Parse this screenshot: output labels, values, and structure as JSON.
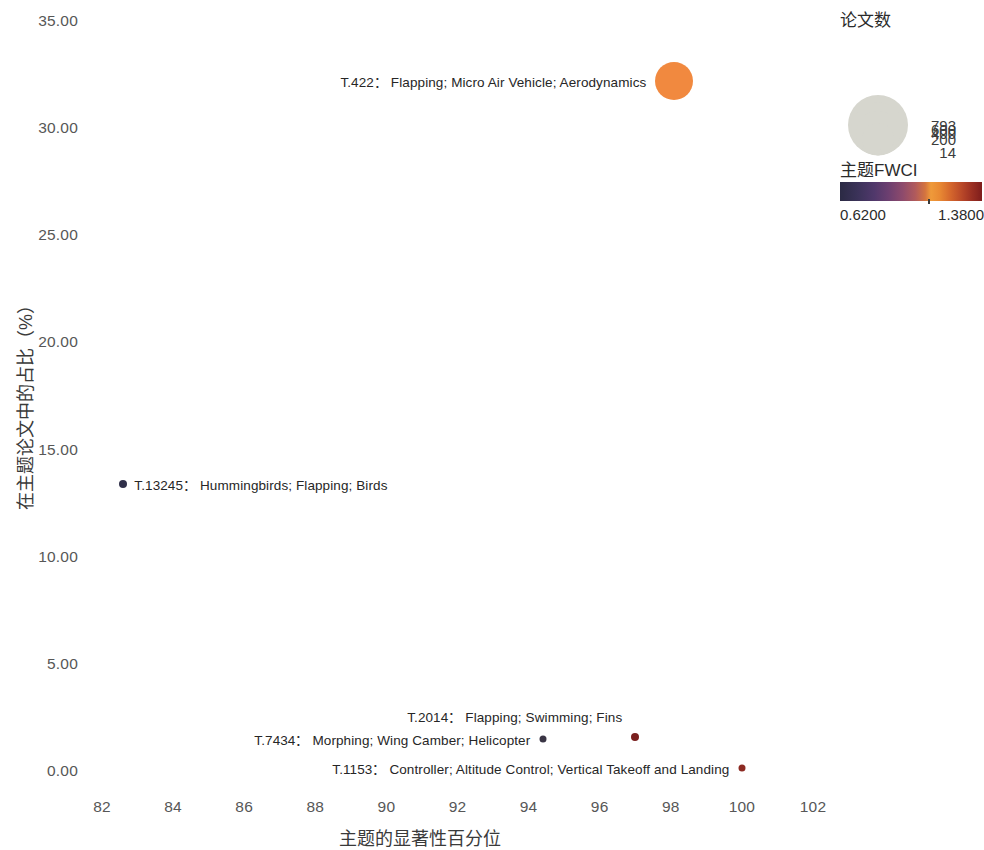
{
  "chart_data": {
    "type": "scatter",
    "title": "",
    "xlabel": "主题的显著性百分位",
    "ylabel": "在主题论文中的占比（%）",
    "xlim": [
      81.0,
      103.0
    ],
    "ylim": [
      -1.2,
      35.8
    ],
    "x_ticks": [
      82,
      84,
      86,
      88,
      90,
      92,
      94,
      96,
      98,
      100,
      102
    ],
    "x_tick_labels": [
      "82",
      "84",
      "86",
      "88",
      "90",
      "92",
      "94",
      "96",
      "98",
      "100",
      "102"
    ],
    "y_ticks": [
      0,
      5,
      10,
      15,
      20,
      25,
      30,
      35
    ],
    "y_tick_labels": [
      "0.00",
      "5.00",
      "10.00",
      "15.00",
      "20.00",
      "25.00",
      "30.00",
      "35.00"
    ],
    "grid": false,
    "legend_position": "right",
    "size_field": "论文数",
    "color_field": "主题FWCI",
    "points": [
      {
        "id": "T.422",
        "keywords": "Flapping; Micro Air Vehicle; Aerodynamics",
        "label": "T.422：  Flapping; Micro Air Vehicle; Aerodynamics",
        "x": 98.1,
        "y": 32.2,
        "papers": 793,
        "fwci": 1.11,
        "color": "#f1893f",
        "radius_px": 19,
        "label_side": "left"
      },
      {
        "id": "T.13245",
        "keywords": "Hummingbirds; Flapping; Birds",
        "label": "T.13245：  Hummingbirds; Flapping; Birds",
        "x": 82.6,
        "y": 13.4,
        "papers": 20,
        "fwci": 0.64,
        "color": "#30304a",
        "radius_px": 4,
        "label_side": "right"
      },
      {
        "id": "T.7434",
        "keywords": "Morphing; Wing Camber; Helicopter",
        "label": "T.7434：  Morphing; Wing Camber; Helicopter",
        "x": 94.4,
        "y": 1.5,
        "papers": 16,
        "fwci": 0.66,
        "color": "#3a3545",
        "radius_px": 3.5,
        "label_side": "left"
      },
      {
        "id": "T.2014",
        "keywords": "Flapping; Swimming; Fins",
        "label": "T.2014：  Flapping; Swimming; Fins",
        "x": 97.0,
        "y": 1.6,
        "papers": 22,
        "fwci": 1.3,
        "color": "#7a1f1e",
        "radius_px": 4,
        "label_side": "left"
      },
      {
        "id": "T.1153",
        "keywords": "Controller; Altitude Control; Vertical Takeoff and Landing",
        "label": "T.1153：  Controller; Altitude Control; Vertical Takeoff and Landing",
        "x": 100.0,
        "y": 0.15,
        "papers": 14,
        "fwci": 1.24,
        "color": "#8c2a22",
        "radius_px": 3.5,
        "label_side": "left"
      }
    ]
  },
  "legend": {
    "size": {
      "title": "论文数",
      "entries": [
        {
          "label": "14",
          "value": 14,
          "radius_px": 3.5
        },
        {
          "label": "200",
          "value": 200,
          "radius_px": 16
        },
        {
          "label": "400",
          "value": 400,
          "radius_px": 22
        },
        {
          "label": "600",
          "value": 600,
          "radius_px": 26.5
        },
        {
          "label": "793",
          "value": 793,
          "radius_px": 30
        }
      ],
      "swatch_color": "#d6d6ce"
    },
    "color": {
      "title": "主题FWCI",
      "min_label": "0.6200",
      "max_label": "1.3800",
      "min_value": 0.62,
      "max_value": 1.38,
      "gradient_stops": [
        "#2b2a44",
        "#50386b",
        "#8d4a6c",
        "#d4743f",
        "#ef9a3a",
        "#b84728",
        "#7e1d1c"
      ]
    }
  }
}
